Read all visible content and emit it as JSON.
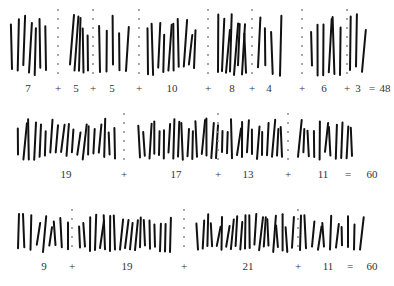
{
  "rows": [
    {
      "groups": [
        {
          "count": 7,
          "label": "7"
        },
        {
          "count": 5,
          "label": "5"
        },
        {
          "count": 5,
          "label": "5"
        },
        {
          "count": 10,
          "label": "10"
        },
        {
          "count": 8,
          "label": "8"
        },
        {
          "count": 4,
          "label": "4"
        },
        {
          "count": 6,
          "label": "6"
        },
        {
          "count": 3,
          "label": "3"
        }
      ],
      "operators": [
        "+",
        "+",
        "+",
        "+",
        "+",
        "+",
        "+"
      ],
      "equals": "=",
      "total": "48"
    },
    {
      "groups": [
        {
          "count": 19,
          "label": "19"
        },
        {
          "count": 17,
          "label": "17"
        },
        {
          "count": 13,
          "label": "13"
        },
        {
          "count": 11,
          "label": "11"
        }
      ],
      "operators": [
        "+",
        "+",
        "+"
      ],
      "equals": "=",
      "total": "60"
    },
    {
      "groups": [
        {
          "count": 9,
          "label": "9"
        },
        {
          "count": 19,
          "label": "19"
        },
        {
          "count": 21,
          "label": "21"
        },
        {
          "count": 11,
          "label": "11"
        }
      ],
      "operators": [
        "+",
        "+",
        "+"
      ],
      "equals": "=",
      "total": "60"
    }
  ],
  "colors": {
    "stroke": "#111111",
    "separator": "#888888",
    "text": "#333333"
  }
}
